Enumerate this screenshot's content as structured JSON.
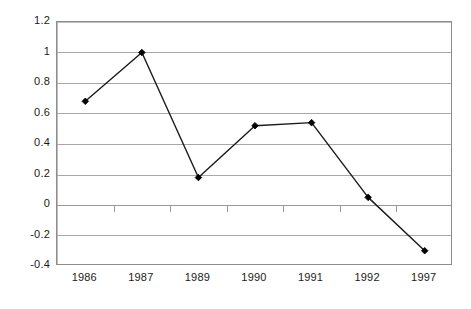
{
  "chart_data": {
    "type": "line",
    "title": "",
    "subtitle": "",
    "xlabel": "",
    "ylabel": "",
    "categories": [
      "1986",
      "1987",
      "1989",
      "1990",
      "1991",
      "1992",
      "1997"
    ],
    "values": [
      0.68,
      1.0,
      0.18,
      0.52,
      0.54,
      0.05,
      -0.3
    ],
    "series": [
      {
        "name": "",
        "values": [
          0.68,
          1.0,
          0.18,
          0.52,
          0.54,
          0.05,
          -0.3
        ]
      }
    ],
    "ylim": [
      -0.4,
      1.2
    ],
    "ytick_labels": [
      "1.2",
      "1",
      "0.8",
      "0.6",
      "0.4",
      "0.2",
      "0",
      "-0.2",
      "-0.4"
    ],
    "ytick_values": [
      1.2,
      1,
      0.8,
      0.6,
      0.4,
      0.2,
      0,
      -0.2,
      -0.4
    ],
    "grid": true,
    "grid_axis": "y",
    "legend": false,
    "legend_position": "none",
    "marker": "diamond",
    "colors": {
      "line": "#1a1a1a",
      "marker": "#000000",
      "gridline": "#a8a8a8",
      "border": "#8c8c8c",
      "text": "#1a1a1a",
      "background": "#ffffff"
    }
  }
}
